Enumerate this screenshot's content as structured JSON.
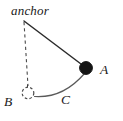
{
  "figure": {
    "background_color": "#ffffff",
    "stroke_color": "#333333",
    "fill_color": "#111111",
    "labels": {
      "anchor": "anchor",
      "point_a": "A",
      "point_b": "B",
      "arc_c": "C"
    },
    "geometry": {
      "anchor_point": {
        "x": 24,
        "y": 21
      },
      "bob_a": {
        "x": 86,
        "y": 68,
        "radius": 6.5,
        "style": "filled"
      },
      "bob_b": {
        "x": 28,
        "y": 93,
        "radius": 6.0,
        "style": "dashed-open"
      },
      "rod_solid": {
        "from": {
          "x": 24,
          "y": 21
        },
        "to": {
          "x": 86,
          "y": 68
        }
      },
      "rod_dashed": {
        "from": {
          "x": 24,
          "y": 21
        },
        "to": {
          "x": 28,
          "y": 87
        }
      },
      "arc_path": {
        "from": {
          "x": 34,
          "y": 96
        },
        "to": {
          "x": 83,
          "y": 74
        },
        "control": {
          "x": 62,
          "y": 98
        }
      },
      "angle_marker": {
        "x": 28,
        "y": 87
      }
    }
  }
}
